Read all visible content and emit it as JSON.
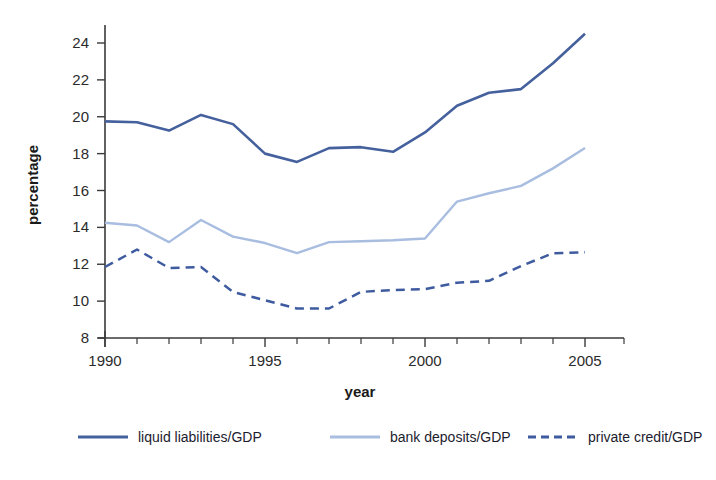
{
  "chart_data": {
    "type": "line",
    "title": "",
    "subtitle": "",
    "xlabel": "year",
    "ylabel": "percentage",
    "xlim": [
      1990,
      2005.9
    ],
    "ylim": [
      8,
      25
    ],
    "yticks": [
      8,
      10,
      12,
      14,
      16,
      18,
      20,
      22,
      24
    ],
    "xticks": [
      1990,
      1995,
      2000,
      2005
    ],
    "xtick_labels": [
      "1990",
      "1995",
      "2000",
      "2005"
    ],
    "ytick_labels": [
      "8",
      "10",
      "12",
      "14",
      "16",
      "18",
      "20",
      "22",
      "24"
    ],
    "x_minor_tick_interval": 1,
    "grid": false,
    "legend_position": "bottom",
    "x": [
      1990,
      1991,
      1992,
      1993,
      1994,
      1995,
      1996,
      1997,
      1998,
      1999,
      2000,
      2001,
      2002,
      2003,
      2004,
      2005
    ],
    "series": [
      {
        "name": "liquid liabilities/GDP",
        "color": "#45619d",
        "style": "solid",
        "width": 2.6,
        "values": [
          19.75,
          19.7,
          19.25,
          20.1,
          19.6,
          18.0,
          17.55,
          18.3,
          18.35,
          18.1,
          19.15,
          20.6,
          21.3,
          21.5,
          22.9,
          24.5
        ]
      },
      {
        "name": "bank deposits/GDP",
        "color": "#a8bde0",
        "style": "solid",
        "width": 2.4,
        "values": [
          14.25,
          14.1,
          13.2,
          14.4,
          13.5,
          13.15,
          12.6,
          13.2,
          13.25,
          13.3,
          13.4,
          15.4,
          15.85,
          16.25,
          17.2,
          18.3
        ]
      },
      {
        "name": "private credit/GDP",
        "color": "#3f5ba0",
        "style": "dashed",
        "width": 2.5,
        "values": [
          11.85,
          12.8,
          11.8,
          11.85,
          10.5,
          10.05,
          9.6,
          9.6,
          10.5,
          10.6,
          10.65,
          11.0,
          11.1,
          11.9,
          12.6,
          12.65
        ]
      }
    ]
  },
  "legend": {
    "entries": [
      {
        "label": "liquid liabilities/GDP",
        "color": "#45619d",
        "style": "solid"
      },
      {
        "label": "bank deposits/GDP",
        "color": "#a8bde0",
        "style": "solid"
      },
      {
        "label": "private credit/GDP",
        "color": "#3f5ba0",
        "style": "dashed"
      }
    ]
  },
  "colors": {
    "liquid_liabilities": "#45619d",
    "bank_deposits": "#a8bde0",
    "private_credit": "#3f5ba0",
    "axis": "#3a3a3a",
    "text": "#1a1a1a",
    "background": "#ffffff"
  }
}
